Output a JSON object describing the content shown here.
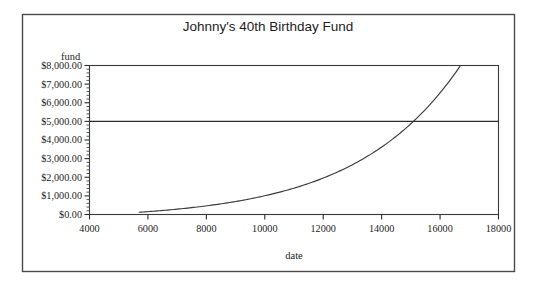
{
  "figure": {
    "title": "Johnny's 40th Birthday Fund",
    "background_color": "#ffffff",
    "border_color": "#4a4a4a",
    "line_color": "#3b3b3b"
  },
  "chart_data": {
    "type": "line",
    "title": "Johnny's 40th Birthday Fund",
    "subtitle": "",
    "xlabel": "date",
    "ylabel": "fund",
    "xlim": [
      4000,
      18000
    ],
    "ylim": [
      0,
      8000
    ],
    "grid": false,
    "legend": "none",
    "x_tick_labels": [
      "4000",
      "6000",
      "8000",
      "10000",
      "12000",
      "14000",
      "16000",
      "18000"
    ],
    "x_ticks": [
      4000,
      6000,
      8000,
      10000,
      12000,
      14000,
      16000,
      18000
    ],
    "x_minor_tick_step": 0,
    "y_tick_labels": [
      "$0.00",
      "$1,000.00",
      "$2,000.00",
      "$3,000.00",
      "$4,000.00",
      "$5,000.00",
      "$6,000.00",
      "$7,000.00",
      "$8,000.00"
    ],
    "y_ticks": [
      0,
      1000,
      2000,
      3000,
      4000,
      5000,
      6000,
      7000,
      8000
    ],
    "y_minor_tick_step": 200,
    "annotations": [
      {
        "name": "goal-reference-line",
        "type": "hline",
        "y": 5000,
        "label": "$5,000.00"
      }
    ],
    "series": [
      {
        "name": "fund",
        "x": [
          5700,
          6000,
          6500,
          7000,
          7500,
          8000,
          8500,
          9000,
          9500,
          10000,
          10500,
          11000,
          11500,
          12000,
          12500,
          13000,
          13500,
          14000,
          14500,
          15000,
          15500,
          16000,
          16500,
          16700
        ],
        "values": [
          120,
          260,
          500,
          760,
          1040,
          1340,
          1660,
          2000,
          2360,
          2740,
          3140,
          3560,
          4000,
          4460,
          4940,
          5440,
          5960,
          5000,
          7060,
          7300,
          7600,
          7850,
          7980,
          8000
        ]
      }
    ]
  },
  "axes": {
    "y_axis_label": "fund",
    "x_axis_label": "date"
  }
}
